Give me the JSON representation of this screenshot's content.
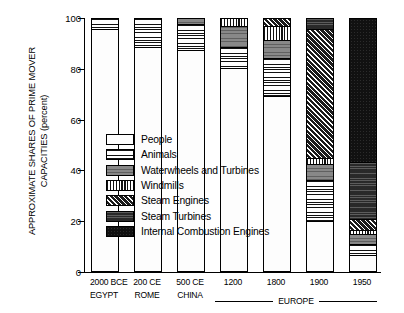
{
  "chart_data": {
    "type": "bar",
    "subtype": "stacked-bar-100-percent",
    "title": "",
    "xlabel": "",
    "ylabel": "APPROXIMATE SHARES OF PRIME MOVER CAPACITIES (percent)",
    "ylabel_line1": "APPROXIMATE SHARES OF PRIME MOVER",
    "ylabel_line2": "CAPACITIES (percent)",
    "ylim": [
      0,
      100
    ],
    "yticks": [
      0,
      20,
      40,
      60,
      80,
      100
    ],
    "grid": false,
    "legend_position": "inside-center-left",
    "categories": [
      "2000 BCE",
      "200 CE",
      "500 CE",
      "1200",
      "1800",
      "1900",
      "1950"
    ],
    "category_sublabels": [
      "EGYPT",
      "ROME",
      "CHINA",
      "",
      "",
      "",
      ""
    ],
    "group_annotation": {
      "label": "EUROPE",
      "covers": [
        "1200",
        "1800",
        "1900",
        "1950"
      ]
    },
    "series": [
      {
        "name": "People",
        "pattern": "sparse-dots",
        "color": "#fdfdfd",
        "values": [
          96,
          89,
          88,
          81,
          70,
          20,
          6
        ]
      },
      {
        "name": "Animals",
        "pattern": "horizontal-lines",
        "color": "#ffffff",
        "values": [
          4,
          11,
          10,
          8,
          15,
          16,
          4
        ]
      },
      {
        "name": "Waterwheels and Turbines",
        "pattern": "solid-gray",
        "color": "#7b7b7b",
        "values": [
          0,
          0,
          2,
          8,
          7,
          6,
          4
        ]
      },
      {
        "name": "Windmills",
        "pattern": "vertical-lines",
        "color": "#ffffff",
        "values": [
          0,
          0,
          0,
          3,
          5,
          2,
          1
        ]
      },
      {
        "name": "Steam Engines",
        "pattern": "diagonal-hatch",
        "color": "#1b1b1b",
        "values": [
          0,
          0,
          0,
          0,
          3,
          52,
          4
        ]
      },
      {
        "name": "Steam Turbines",
        "pattern": "dark-gray",
        "color": "#3b3b3b",
        "values": [
          0,
          0,
          0,
          0,
          0,
          4,
          23
        ]
      },
      {
        "name": "Internal Combustion Engines",
        "pattern": "solid-black",
        "color": "#111111",
        "values": [
          0,
          0,
          0,
          0,
          0,
          0,
          58
        ]
      }
    ]
  },
  "legend": {
    "items": [
      {
        "label": "People",
        "pattern_class": "p-people"
      },
      {
        "label": "Animals",
        "pattern_class": "p-animals"
      },
      {
        "label": "Waterwheels and Turbines",
        "pattern_class": "p-waterwheels"
      },
      {
        "label": "Windmills",
        "pattern_class": "p-windmills"
      },
      {
        "label": "Steam Engines",
        "pattern_class": "p-steam-engines"
      },
      {
        "label": "Steam Turbines",
        "pattern_class": "p-steam-turbines"
      },
      {
        "label": "Internal Combustion Engines",
        "pattern_class": "p-ice"
      }
    ]
  }
}
